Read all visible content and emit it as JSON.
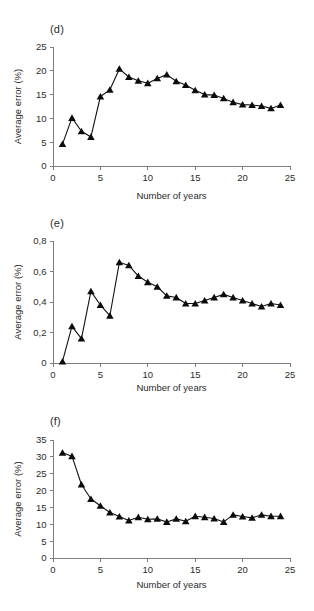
{
  "figure": {
    "width": 314,
    "height": 611,
    "background": "#ffffff",
    "ink_color": "#111111",
    "axis_color": "#7d7d7d"
  },
  "panels": [
    {
      "id": "panel-d",
      "label": "(d)"
    },
    {
      "id": "panel-e",
      "label": "(e)"
    },
    {
      "id": "panel-f",
      "label": "(f)"
    }
  ],
  "chart_data": [
    {
      "type": "line",
      "panel": "(d)",
      "title": "",
      "xlabel": "Number of years",
      "ylabel": "Average error (%)",
      "xlim": [
        0,
        25
      ],
      "ylim": [
        0,
        25
      ],
      "xticks": [
        0,
        5,
        10,
        15,
        20,
        25
      ],
      "xticklabels": [
        "0",
        "5",
        "10",
        "15",
        "20",
        "25"
      ],
      "yticks": [
        0,
        5,
        10,
        15,
        20,
        25
      ],
      "yticklabels": [
        "0",
        "5",
        "10",
        "15",
        "20",
        "25"
      ],
      "grid": false,
      "legend": null,
      "marker": "triangle-up",
      "x": [
        1,
        2,
        3,
        4,
        5,
        6,
        7,
        8,
        9,
        10,
        11,
        12,
        13,
        14,
        15,
        16,
        17,
        18,
        19,
        20,
        21,
        22,
        23,
        24
      ],
      "values": [
        4.6,
        10.1,
        7.3,
        6.1,
        14.6,
        16.0,
        20.4,
        18.7,
        17.9,
        17.4,
        18.4,
        19.2,
        17.8,
        17.0,
        15.9,
        15.0,
        14.9,
        14.2,
        13.4,
        12.9,
        12.8,
        12.6,
        12.1,
        12.8
      ]
    },
    {
      "type": "line",
      "panel": "(e)",
      "title": "",
      "xlabel": "Number of years",
      "ylabel": "Average error (%)",
      "xlim": [
        0,
        25
      ],
      "ylim": [
        0,
        0.8
      ],
      "xticks": [
        0,
        5,
        10,
        15,
        20,
        25
      ],
      "xticklabels": [
        "0",
        "5",
        "10",
        "15",
        "20",
        "25"
      ],
      "yticks": [
        0,
        0.2,
        0.4,
        0.6,
        0.8
      ],
      "yticklabels": [
        "0",
        "0,2",
        "0,4",
        "0,6",
        "0,8"
      ],
      "grid": false,
      "legend": null,
      "marker": "triangle-up",
      "x": [
        1,
        2,
        3,
        4,
        5,
        6,
        7,
        8,
        9,
        10,
        11,
        12,
        13,
        14,
        15,
        16,
        17,
        18,
        19,
        20,
        21,
        22,
        23,
        24
      ],
      "values": [
        0.01,
        0.24,
        0.16,
        0.47,
        0.38,
        0.31,
        0.66,
        0.64,
        0.57,
        0.53,
        0.5,
        0.44,
        0.43,
        0.39,
        0.39,
        0.41,
        0.43,
        0.45,
        0.43,
        0.41,
        0.39,
        0.37,
        0.39,
        0.38
      ]
    },
    {
      "type": "line",
      "panel": "(f)",
      "title": "",
      "xlabel": "Number of years",
      "ylabel": "Average error (%)",
      "xlim": [
        0,
        25
      ],
      "ylim": [
        0,
        35
      ],
      "xticks": [
        0,
        5,
        10,
        15,
        20,
        25
      ],
      "xticklabels": [
        "0",
        "5",
        "10",
        "15",
        "20",
        "25"
      ],
      "yticks": [
        0,
        5,
        10,
        15,
        20,
        25,
        30,
        35
      ],
      "yticklabels": [
        "0",
        "5",
        "10",
        "15",
        "20",
        "25",
        "30",
        "35"
      ],
      "grid": false,
      "legend": null,
      "marker": "triangle-up",
      "x": [
        1,
        2,
        3,
        4,
        5,
        6,
        7,
        8,
        9,
        10,
        11,
        12,
        13,
        14,
        15,
        16,
        17,
        18,
        19,
        20,
        21,
        22,
        23,
        24
      ],
      "values": [
        31.2,
        30.2,
        21.8,
        17.5,
        15.5,
        13.5,
        12.3,
        11.1,
        12.1,
        11.5,
        11.6,
        10.7,
        11.6,
        10.9,
        12.4,
        12.1,
        11.7,
        10.7,
        12.8,
        12.3,
        11.9,
        12.8,
        12.4,
        12.4
      ]
    }
  ]
}
